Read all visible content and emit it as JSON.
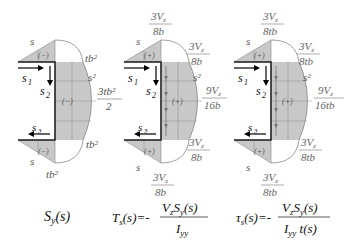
{
  "colors": {
    "fill": "#c8c8c8",
    "grid": "#888888",
    "outline": "#333333",
    "curve": "#777777",
    "text": "#555555"
  },
  "panels": [
    {
      "id": "first-moment",
      "top_flange_label": "s",
      "web_label": "s²",
      "sign_top": "(−)",
      "sign_web": "(−)",
      "sign_bottom": "(−)",
      "val_top_corner": "tb²",
      "val_mid_num": "3tb²",
      "val_mid_den": "2",
      "val_bot_corner": "tb²",
      "val_bottom": "tb²",
      "bottom_flange_label": "s",
      "s1": "s",
      "s1_sub": "1",
      "s2": "s",
      "s2_sub": "2",
      "s3": "s",
      "s3_sub": "3",
      "formula": "S_y(s)"
    },
    {
      "id": "shear-flow",
      "top_num": "3V_z",
      "top_den": "8b",
      "corner_num": "3V_z",
      "corner_den": "8b",
      "mid_num": "9V_z",
      "mid_den": "16b",
      "bot_corner_num": "3V_z",
      "bot_corner_den": "8b",
      "bottom_num": "3V_z",
      "bottom_den": "8b",
      "sign": "(+)",
      "web_label": "s²",
      "flange_label": "s",
      "formula_lhs": "T_s(s)=-",
      "formula_num": "V_z S_y(s)",
      "formula_den": "I_yy"
    },
    {
      "id": "shear-stress",
      "top_num": "3V_z",
      "top_den": "8tb",
      "corner_num": "3V_z",
      "corner_den": "8tb",
      "mid_num": "9V_z",
      "mid_den": "16tb",
      "bot_corner_num": "3V_z",
      "bot_corner_den": "8tb",
      "bottom_num": "3V_z",
      "bottom_den": "8tb",
      "sign": "(+)",
      "web_label": "s²",
      "flange_label": "s",
      "formula_lhs": "τ_s(s)=-",
      "formula_num": "V_z S_y(s)",
      "formula_den": "I_yy t(s)"
    }
  ]
}
